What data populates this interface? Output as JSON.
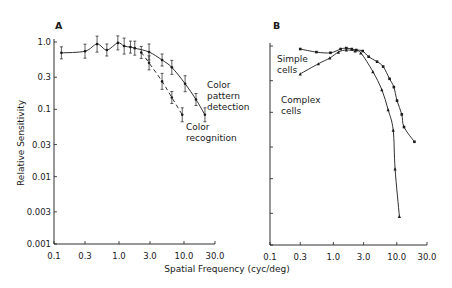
{
  "figure": {
    "xlabel": "Spatial Frequency (cyc/deg)",
    "ylabel": "Relative Sensitivity"
  },
  "chart_data": [
    {
      "type": "line",
      "panel": "A",
      "title": "A",
      "xlabel": "Spatial Frequency (cyc/deg)",
      "ylabel": "Relative Sensitivity",
      "xscale": "log",
      "yscale": "log",
      "xlim": [
        0.1,
        30.0
      ],
      "ylim": [
        0.001,
        1.0
      ],
      "xticks": [
        "0.1",
        "0.3",
        "1.0",
        "3.0",
        "10.0",
        "30.0"
      ],
      "yticks": [
        "1.0",
        "0.3",
        "0.1",
        "0.03",
        "0.01",
        "0.003",
        "0.001"
      ],
      "grid": false,
      "series": [
        {
          "name": "Color pattern detection",
          "style": "solid line, points with error bars",
          "x": [
            0.13,
            0.3,
            0.46,
            0.65,
            0.96,
            1.2,
            1.5,
            1.75,
            2.9,
            4.6,
            6.5,
            10.4,
            15.3,
            21.0
          ],
          "y": [
            0.69,
            0.73,
            0.93,
            0.76,
            0.97,
            0.87,
            0.84,
            0.81,
            0.71,
            0.54,
            0.42,
            0.24,
            0.14,
            0.083
          ]
        },
        {
          "name": "Color recognition",
          "style": "dashed line, points with error bars",
          "x": [
            2.2,
            2.9,
            4.6,
            6.5,
            9.4
          ],
          "y": [
            0.7,
            0.49,
            0.26,
            0.15,
            0.083
          ]
        }
      ],
      "annotations": [
        "Color pattern detection",
        "Color recognition"
      ]
    },
    {
      "type": "line",
      "panel": "B",
      "title": "B",
      "xlabel": "Spatial Frequency (cyc/deg)",
      "ylabel": "Relative Sensitivity",
      "xscale": "log",
      "yscale": "log",
      "xlim": [
        0.1,
        30.0
      ],
      "ylim": [
        0.001,
        1.0
      ],
      "xticks": [
        "0.1",
        "0.3",
        "1.0",
        "3.0",
        "10.0",
        "30.0"
      ],
      "yticks": [],
      "grid": false,
      "series": [
        {
          "name": "Simple cells",
          "style": "solid line with square markers",
          "x": [
            0.3,
            0.54,
            0.9,
            1.3,
            1.6,
            1.95,
            2.3,
            2.9,
            3.6,
            4.9,
            6.1,
            7.7,
            9.0,
            10.1,
            12.0,
            13.0,
            19.0
          ],
          "y": [
            0.9,
            0.81,
            0.79,
            0.9,
            0.93,
            0.9,
            0.87,
            0.84,
            0.69,
            0.58,
            0.49,
            0.32,
            0.24,
            0.15,
            0.093,
            0.06,
            0.036
          ]
        },
        {
          "name": "Complex cells",
          "style": "solid line with triangle markers",
          "x": [
            0.3,
            0.58,
            0.88,
            1.2,
            1.6,
            2.2,
            2.7,
            4.2,
            5.8,
            7.3,
            8.8,
            9.4,
            11.0
          ],
          "y": [
            0.38,
            0.54,
            0.66,
            0.81,
            0.87,
            0.84,
            0.79,
            0.41,
            0.22,
            0.11,
            0.054,
            0.014,
            0.0027
          ]
        }
      ],
      "annotations": [
        "Simple cells",
        "Complex cells"
      ]
    }
  ],
  "panels": {
    "a": {
      "letter": "A",
      "annot_pattern": [
        "Color",
        "pattern",
        "detection"
      ],
      "annot_recog": [
        "Color",
        "recognition"
      ]
    },
    "b": {
      "letter": "B",
      "annot_simple": [
        "Simple",
        "cells"
      ],
      "annot_complex": [
        "Complex",
        "cells"
      ]
    }
  },
  "colors": {
    "ink": "#1a1a1a",
    "background": "#ffffff"
  }
}
